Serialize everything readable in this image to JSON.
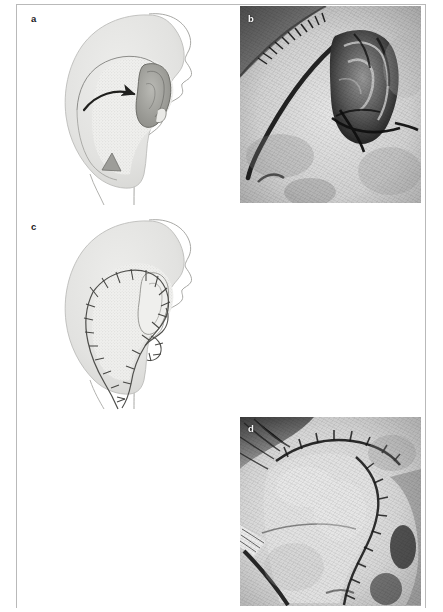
{
  "figure": {
    "kind": "surgical-case-figure",
    "panel_count": 5,
    "page_width": 443,
    "page_height": 612,
    "colors": {
      "page_background": "#ffffff",
      "rule": "#b9b9b9",
      "drawing_line": "#8d8d8d",
      "drawing_skin_fill": "#f3f3f2",
      "drawing_scalp_fill": "#e3e3e1",
      "drawing_flap_stipple": "#d8d8d6",
      "drawing_arrow": "#1f1f1d",
      "photo_label_light": "#f2f2f0",
      "photo_label_dark": "#20201e"
    }
  },
  "panels": [
    {
      "id": "a",
      "label": "a",
      "type": "line-drawing",
      "label_color": "dark",
      "description": "Lateral head and neck line drawing showing a stippled cervicofacial flap territory on the temporo-parietal scalp, a curved rotation arrow directed anteriorly toward the auricle, and an inferior Burow's triangle marked below the flap base.",
      "elements": [
        "head-profile-outline",
        "scalp-shading",
        "flap-stipple-area",
        "rotation-arrow",
        "auricle",
        "burow-triangle"
      ]
    },
    {
      "id": "b",
      "label": "b",
      "type": "photograph",
      "label_color": "light",
      "description": "Intraoperative black-and-white photograph of the periauricular defect with the auricle retracted and the surgical incision line marked."
    },
    {
      "id": "c",
      "label": "c",
      "type": "line-drawing",
      "label_color": "dark",
      "description": "Lateral head and neck line drawing after flap transposition showing the sutured closure line running around the flap margin and the auricle with interrupted suture marks.",
      "elements": [
        "head-profile-outline",
        "scalp-shading",
        "flap-stipple-area",
        "suture-line",
        "auricle",
        "suture-marks"
      ]
    },
    {
      "id": "d",
      "label": "d",
      "type": "photograph",
      "label_color": "light",
      "description": "Immediate postoperative black-and-white photograph showing the transposed flap inset with the suture line along its entire margin."
    },
    {
      "id": "e",
      "label": "e",
      "type": "photograph",
      "label_color": "dark",
      "description": "Late postoperative black-and-white photograph of the healed lateral neck and preauricular region with surgical drapes at the field margins."
    }
  ]
}
